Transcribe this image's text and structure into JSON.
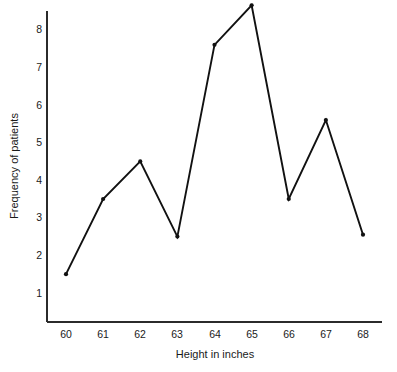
{
  "chart_data": {
    "type": "line",
    "title": "",
    "subtitle": "",
    "xlabel": "Height in inches",
    "ylabel": "Frequency of patients",
    "x": [
      60,
      61,
      62,
      63,
      64,
      65,
      66,
      67,
      68
    ],
    "categories": [
      "60",
      "61",
      "62",
      "63",
      "64",
      "65",
      "66",
      "67",
      "68"
    ],
    "values": [
      1.5,
      3.5,
      4.5,
      2.5,
      7.6,
      8.65,
      3.5,
      5.6,
      2.55
    ],
    "series": [
      {
        "name": "Frequency of patients",
        "values": [
          1.5,
          3.5,
          4.5,
          2.5,
          7.6,
          8.65,
          3.5,
          5.6,
          2.55
        ]
      }
    ],
    "xticks": [
      "60",
      "61",
      "62",
      "63",
      "64",
      "65",
      "66",
      "67",
      "68"
    ],
    "yticks": [
      "1",
      "2",
      "3",
      "4",
      "5",
      "6",
      "7",
      "8"
    ],
    "ytick_values": [
      1,
      2,
      3,
      4,
      5,
      6,
      7,
      8
    ],
    "xlim": [
      59.6,
      68.6
    ],
    "ylim": [
      0.4,
      8.9
    ],
    "grid": false,
    "legend": false,
    "legend_position": "none",
    "line_color": "#111111",
    "marker": "dot",
    "axis_color": "#2b2b2b",
    "background_color": "#ffffff"
  }
}
